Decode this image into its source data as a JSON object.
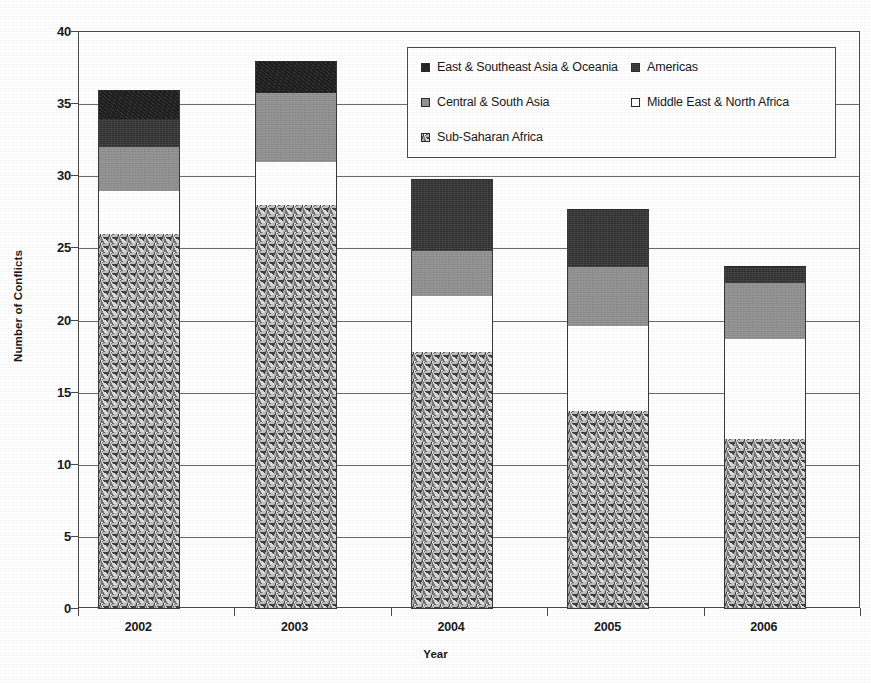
{
  "chart_data": {
    "type": "bar",
    "subtype": "stacked-bar",
    "title": "",
    "xlabel": "Year",
    "ylabel": "Number of Conflicts",
    "categories": [
      "2002",
      "2003",
      "2004",
      "2005",
      "2006"
    ],
    "ylim": [
      0,
      40
    ],
    "yticks": [
      0,
      5,
      10,
      15,
      20,
      25,
      30,
      35,
      40
    ],
    "ytick_labels": [
      "0",
      "5",
      "10",
      "15",
      "20",
      "25",
      "30",
      "35",
      "40"
    ],
    "grid": true,
    "grid_axis": "y",
    "legend_position": "top-right",
    "stack_order_bottom_to_top": [
      "Sub-Saharan Africa",
      "Middle East & North Africa",
      "Central & South Asia",
      "Americas",
      "East & Southeast Asia & Oceania"
    ],
    "series": [
      {
        "name": "Sub-Saharan Africa",
        "fill": "speckle",
        "color": "#a9a9a9",
        "values": [
          26,
          28,
          17.8,
          13.7,
          11.8
        ]
      },
      {
        "name": "Middle East & North Africa",
        "fill": "white",
        "color": "#ffffff",
        "values": [
          3,
          3,
          3.9,
          5.9,
          6.9
        ]
      },
      {
        "name": "Central & South Asia",
        "fill": "midgray",
        "color": "#8f8f8f",
        "values": [
          3,
          4.8,
          3.1,
          4.1,
          3.9
        ]
      },
      {
        "name": "Americas",
        "fill": "darkgray",
        "color": "#2e2e2e",
        "values": [
          2,
          0,
          5,
          4,
          1.2
        ]
      },
      {
        "name": "East & Southeast Asia & Oceania",
        "fill": "black",
        "color": "#1d1d1d",
        "values": [
          2,
          2.2,
          0,
          0,
          0
        ]
      }
    ],
    "totals": [
      36,
      38,
      29.8,
      27.7,
      23.8
    ]
  },
  "legend": {
    "items": [
      {
        "label": "East & Southeast Asia & Oceania",
        "fill": "black",
        "row": 0,
        "col": 0
      },
      {
        "label": "Americas",
        "fill": "darkgray",
        "row": 0,
        "col": 1
      },
      {
        "label": "Central & South Asia",
        "fill": "midgray",
        "row": 1,
        "col": 0
      },
      {
        "label": "Middle East & North Africa",
        "fill": "white",
        "row": 1,
        "col": 1
      },
      {
        "label": "Sub-Saharan Africa",
        "fill": "speckle",
        "row": 2,
        "col": 0
      }
    ]
  },
  "caption": {
    "text": ""
  }
}
